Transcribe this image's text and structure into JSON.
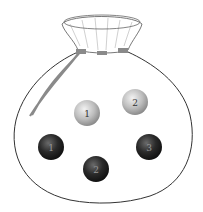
{
  "figure": {
    "colors": {
      "bag_outline": "#333333",
      "rope": "#8a8a8a",
      "light_ball": "#c8c8c8",
      "dark_ball": "#2a2a2a",
      "light_label": "#333333",
      "dark_label": "#999999"
    },
    "balls": [
      {
        "shade": "light",
        "label": "1",
        "cx": 87,
        "cy": 113
      },
      {
        "shade": "light",
        "label": "2",
        "cx": 135,
        "cy": 102
      },
      {
        "shade": "dark",
        "label": "1",
        "cx": 51,
        "cy": 147
      },
      {
        "shade": "dark",
        "label": "2",
        "cx": 96,
        "cy": 169
      },
      {
        "shade": "dark",
        "label": "3",
        "cx": 149,
        "cy": 147
      }
    ]
  }
}
